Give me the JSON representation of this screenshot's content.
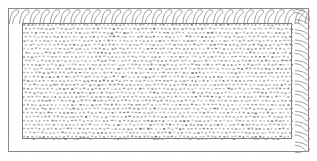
{
  "figure": {
    "kind": "technical-cross-section-diagram",
    "width": 317,
    "height": 161,
    "background_color": "#ffffff",
    "text_content": "",
    "caption": "",
    "labels": [],
    "dimensions_shown": []
  },
  "outer_shell": {
    "name": "outer-hatched-band",
    "x": 8,
    "y": 8,
    "width": 301,
    "height": 144,
    "border_color": "#8a8a8a",
    "border_width": 1,
    "fill_color": "#ffffff",
    "hatch_pattern": "chain-hook-insulation",
    "hatch_stroke_color": "#8d8d8d",
    "hatch_stroke_width": 0.85,
    "band_thickness": 15
  },
  "inner_core": {
    "name": "inner-stipple-region",
    "x": 22,
    "y": 23,
    "width": 270,
    "height": 116,
    "border_color": "#7e7e7e",
    "border_width": 1,
    "fill_color": "#ffffff",
    "hatch_pattern": "staggered-dash-stipple",
    "stipple_color": "#9a9a9a",
    "stipple_cell": 4,
    "stipple_dash_width": 2.1,
    "stipple_dash_height": 1.5
  },
  "colors": {
    "page_background": "#ffffff",
    "line_gray": "#8a8a8a",
    "stipple_gray": "#9a9a9a",
    "dark_gray": "#6f6f6f"
  }
}
